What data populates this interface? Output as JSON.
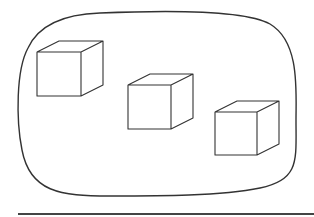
{
  "diagram": {
    "stroke_color": "#333333",
    "background": "#ffffff",
    "boundary": {
      "shape": "rounded-rectangle",
      "path": "M 100 13 C 170 10 245 10 270 24 C 300 42 296 90 296 120 C 296 160 300 180 260 188 C 220 196 160 196 110 196 C 60 196 30 192 22 150 C 16 120 16 70 28 48 C 40 22 70 14 100 13 Z"
    },
    "cubes": [
      {
        "id": "cube-1",
        "front": [
          37,
          52,
          81,
          96
        ],
        "offset": [
          22,
          -11
        ]
      },
      {
        "id": "cube-2",
        "front": [
          128,
          85,
          171,
          129
        ],
        "offset": [
          22,
          -11
        ]
      },
      {
        "id": "cube-3",
        "front": [
          215,
          112,
          257,
          155
        ],
        "offset": [
          22,
          -11
        ]
      }
    ],
    "baseline": {
      "x1": 18,
      "y1": 214,
      "x2": 314,
      "y2": 214
    }
  }
}
